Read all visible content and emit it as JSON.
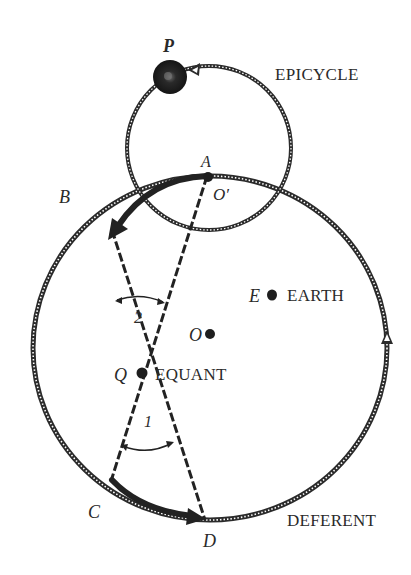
{
  "diagram": {
    "labels": {
      "planet": "P",
      "epicycle": "EPICYCLE",
      "point_a": "A",
      "epicycle_center": "O′",
      "point_b": "B",
      "earth_letter": "E",
      "earth": "EARTH",
      "center_letter": "O",
      "angle_2": "2",
      "equant_letter": "Q",
      "equant": "EQUANT",
      "angle_1": "1",
      "point_c": "C",
      "point_d": "D",
      "deferent": "DEFERENT"
    },
    "colors": {
      "stroke": "#2b2b2b",
      "fill_dark": "#1e1e1e",
      "background": "#ffffff"
    }
  }
}
